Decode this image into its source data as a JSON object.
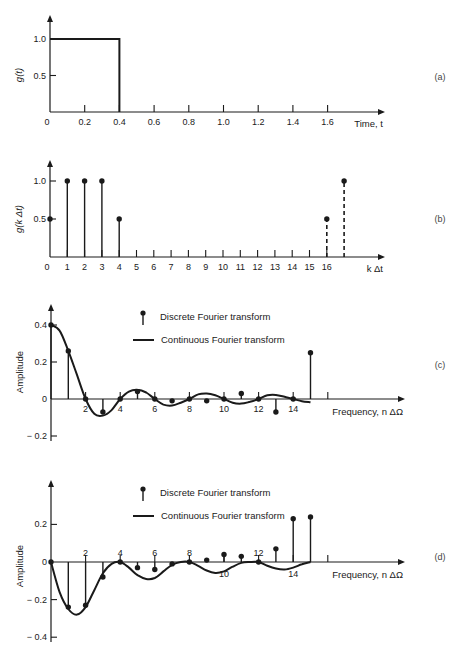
{
  "chart_data": [
    {
      "id": "a",
      "panel_label": "(a)",
      "type": "line",
      "title": "",
      "xlabel": "Time, t",
      "ylabel": "g(t)",
      "x_ticks": [
        0,
        0.2,
        0.4,
        0.6,
        0.8,
        1.0,
        1.2,
        1.4,
        1.6
      ],
      "x_tick_labels": [
        "0",
        "0.2",
        "0.4",
        "0.6",
        "0.8",
        "1.0",
        "1.2",
        "1.4",
        "1.6"
      ],
      "y_ticks": [
        0.5,
        1.0
      ],
      "y_tick_labels": [
        "0.5",
        "1.0"
      ],
      "xlim": [
        0,
        1.85
      ],
      "ylim": [
        0,
        1.25
      ],
      "grid": false,
      "series": [
        {
          "name": "g(t) rectangular pulse",
          "x": [
            0,
            0.4,
            0.4,
            1.75
          ],
          "y": [
            1.0,
            1.0,
            0,
            0
          ]
        }
      ]
    },
    {
      "id": "b",
      "panel_label": "(b)",
      "type": "stem",
      "xlabel": "k Δt",
      "ylabel": "g(k Δt)",
      "x_ticks": [
        0,
        1,
        2,
        3,
        4,
        5,
        6,
        7,
        8,
        9,
        10,
        11,
        12,
        13,
        14,
        15,
        16
      ],
      "x_tick_labels": [
        "0",
        "1",
        "2",
        "3",
        "4",
        "5",
        "6",
        "7",
        "8",
        "9",
        "10",
        "11",
        "12",
        "13",
        "14",
        "15",
        "16"
      ],
      "y_ticks": [
        0.5,
        1.0
      ],
      "y_tick_labels": [
        "0.5",
        "1.0"
      ],
      "xlim": [
        0,
        17.8
      ],
      "ylim": [
        0,
        1.25
      ],
      "grid": false,
      "series": [
        {
          "name": "samples",
          "style": "solid",
          "x": [
            0,
            1,
            2,
            3,
            4
          ],
          "y": [
            0.5,
            1.0,
            1.0,
            1.0,
            0.5
          ]
        },
        {
          "name": "periodic extension",
          "style": "dashed",
          "x": [
            16,
            17
          ],
          "y": [
            0.5,
            1.0
          ]
        }
      ]
    },
    {
      "id": "c",
      "panel_label": "(c)",
      "type": "stem+line",
      "xlabel": "Frequency, n ΔΩ",
      "ylabel": "Amplitude",
      "x_ticks": [
        2,
        4,
        6,
        8,
        10,
        12,
        14
      ],
      "x_tick_labels": [
        "2",
        "4",
        "6",
        "8",
        "10",
        "12",
        "14"
      ],
      "y_ticks": [
        0.4,
        0.2,
        0,
        -0.2
      ],
      "y_tick_labels": [
        "0.4",
        "0.2",
        "0",
        "− 0.2"
      ],
      "xlim": [
        0,
        17.5
      ],
      "ylim": [
        -0.25,
        0.5
      ],
      "grid": false,
      "legend": [
        {
          "symbol": "stem",
          "label": "Discrete Fourier transform"
        },
        {
          "symbol": "line",
          "label": "Continuous Fourier transform"
        }
      ],
      "legend_position": "top-center",
      "series": [
        {
          "name": "Discrete Fourier transform",
          "n": [
            0,
            1,
            2,
            3,
            4,
            5,
            6,
            7,
            8,
            9,
            10,
            11,
            12,
            13,
            14,
            15
          ],
          "values": [
            0.4,
            0.26,
            0,
            -0.07,
            0,
            0.04,
            0,
            -0.01,
            0,
            -0.01,
            0,
            0.03,
            0,
            -0.07,
            0,
            0.25
          ]
        },
        {
          "name": "Continuous Fourier transform",
          "n": [
            0,
            0.5,
            1,
            1.5,
            2,
            2.5,
            3,
            3.5,
            4,
            4.5,
            5,
            5.5,
            6,
            6.5,
            7,
            7.5,
            8,
            8.5,
            9,
            9.5,
            10,
            10.5,
            11,
            11.5,
            12,
            12.5,
            13,
            13.5,
            14,
            14.5,
            15
          ],
          "values": [
            0.4,
            0.37,
            0.26,
            0.13,
            0,
            -0.08,
            -0.09,
            -0.06,
            0,
            0.04,
            0.05,
            0.035,
            0,
            -0.03,
            -0.035,
            -0.02,
            0,
            0.025,
            0.03,
            0.02,
            0,
            -0.02,
            -0.025,
            -0.015,
            0,
            0.02,
            0.022,
            0.012,
            0,
            -0.012,
            -0.018
          ]
        }
      ]
    },
    {
      "id": "d",
      "panel_label": "(d)",
      "type": "stem+line",
      "xlabel": "Frequency, n ΔΩ",
      "ylabel": "Amplitude",
      "x_ticks": [
        2,
        4,
        6,
        8,
        10,
        12,
        14
      ],
      "x_tick_labels": [
        "2",
        "4",
        "6",
        "8",
        "10",
        "12",
        "14"
      ],
      "y_ticks": [
        0.2,
        0,
        -0.2,
        -0.4
      ],
      "y_tick_labels": [
        "0.2",
        "0",
        "− 0.2",
        "− 0.4"
      ],
      "xlim": [
        0,
        17.5
      ],
      "ylim": [
        -0.45,
        0.45
      ],
      "grid": false,
      "legend": [
        {
          "symbol": "stem",
          "label": "Discrete Fourier transform"
        },
        {
          "symbol": "line",
          "label": "Continuous Fourier transform"
        }
      ],
      "legend_position": "top-center",
      "series": [
        {
          "name": "Discrete Fourier transform",
          "n": [
            0,
            1,
            2,
            3,
            4,
            5,
            6,
            7,
            8,
            9,
            10,
            11,
            12,
            13,
            14,
            15
          ],
          "values": [
            0,
            -0.24,
            -0.23,
            -0.08,
            0,
            -0.03,
            -0.04,
            -0.01,
            0,
            0.01,
            0.04,
            0.03,
            0,
            0.07,
            0.23,
            0.24
          ]
        },
        {
          "name": "Continuous Fourier transform",
          "n": [
            0,
            0.5,
            1,
            1.5,
            2,
            2.5,
            3,
            3.5,
            4,
            4.5,
            5,
            5.5,
            6,
            6.5,
            7,
            7.5,
            8,
            8.5,
            9,
            9.5,
            10,
            10.5,
            11,
            11.5,
            12,
            12.5,
            13,
            13.5,
            14,
            14.5,
            15
          ],
          "values": [
            0,
            -0.16,
            -0.25,
            -0.28,
            -0.24,
            -0.15,
            -0.06,
            -0.01,
            0,
            -0.03,
            -0.07,
            -0.09,
            -0.085,
            -0.05,
            -0.015,
            0,
            0,
            -0.02,
            -0.045,
            -0.058,
            -0.05,
            -0.025,
            -0.005,
            0,
            0,
            -0.02,
            -0.035,
            -0.04,
            -0.03,
            -0.012,
            0
          ]
        }
      ]
    }
  ]
}
